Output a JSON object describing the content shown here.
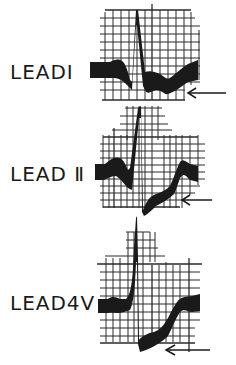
{
  "figure": {
    "leads": [
      {
        "id": "lead-1",
        "label": "LEADI",
        "display": "LEAD I"
      },
      {
        "id": "lead-2",
        "label": "LEAD II",
        "display": "LEAD Ⅱ"
      },
      {
        "id": "lead-3",
        "label": "LEAD4V",
        "display": "LEAD4V"
      }
    ],
    "colors": {
      "ink": "#1a1a1a",
      "grid": "#2a2a2a",
      "background": "#ffffff"
    }
  }
}
